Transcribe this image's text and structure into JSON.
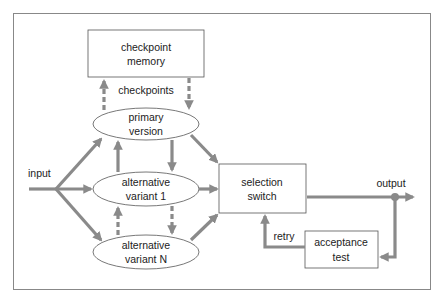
{
  "diagram": {
    "nodes": {
      "checkpoint_memory": [
        "checkpoint",
        "memory"
      ],
      "primary_version": [
        "primary",
        "version"
      ],
      "alt_variant_1": [
        "alternative",
        "variant 1"
      ],
      "alt_variant_n": [
        "alternative",
        "variant N"
      ],
      "selection_switch": [
        "selection",
        "switch"
      ],
      "acceptance_test": [
        "acceptance",
        "test"
      ]
    },
    "edge_labels": {
      "checkpoints": "checkpoints",
      "input": "input",
      "output": "output",
      "retry": "retry"
    },
    "colors": {
      "arrow": "#8a8a8a",
      "node_stroke": "#555555",
      "frame": "#888888"
    }
  }
}
